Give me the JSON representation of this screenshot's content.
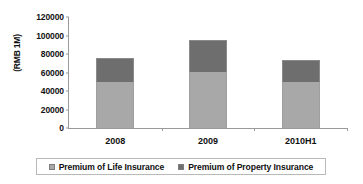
{
  "chart_data": {
    "type": "bar",
    "stacked": true,
    "title": "",
    "xlabel": "",
    "ylabel": "(RMB 1M)",
    "categories": [
      "2008",
      "2009",
      "2010H1"
    ],
    "series": [
      {
        "name": "Premium of Life Insurance",
        "color": "#a8a8a8",
        "values": [
          49700,
          60500,
          49700
        ]
      },
      {
        "name": "Premium of Property Insurance",
        "color": "#6e6e6e",
        "values": [
          26000,
          34500,
          23800
        ]
      }
    ],
    "totals": [
      75700,
      95000,
      73500
    ],
    "ylim": [
      0,
      120000
    ],
    "yticks": [
      0,
      20000,
      40000,
      60000,
      80000,
      100000,
      120000
    ],
    "ytick_labels": [
      "0",
      "20000",
      "40000",
      "60000",
      "80000",
      "100000",
      "120000"
    ],
    "grid": false,
    "legend_position": "bottom"
  },
  "axis": {
    "y_title": "(RMB 1M)"
  },
  "legend": {
    "items": [
      {
        "label": "Premium of Life Insurance",
        "swatch_color": "#a8a8a8"
      },
      {
        "label": "Premium of Property Insurance",
        "swatch_color": "#6e6e6e"
      }
    ]
  }
}
